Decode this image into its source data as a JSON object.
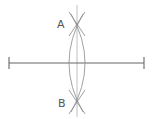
{
  "diagram": {
    "labels": {
      "a": "A",
      "b": "B"
    },
    "colors": {
      "segment": "#666666",
      "arcs": "#888888",
      "bisector": "#aaaaaa",
      "label": "#555555"
    },
    "segment": {
      "x1": 9,
      "x2": 144,
      "y": 63,
      "tick_half": 6
    },
    "points": {
      "A": {
        "x": 77,
        "y": 24
      },
      "B": {
        "x": 77,
        "y": 102
      }
    },
    "bisector": {
      "x": 77,
      "y1": 5,
      "y2": 117
    }
  }
}
